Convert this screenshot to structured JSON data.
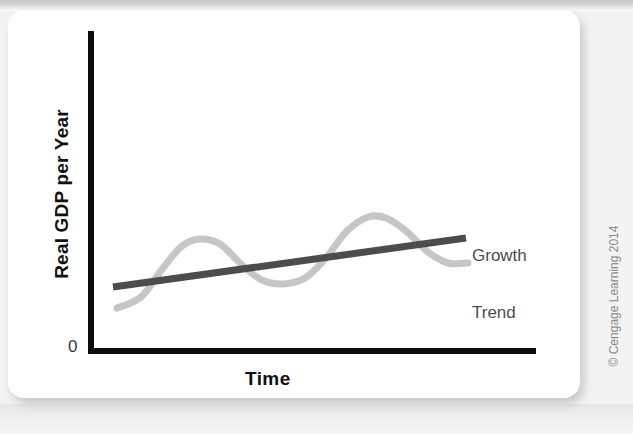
{
  "figure": {
    "credit": "© Cengage Learning 2014"
  },
  "chart_data": {
    "type": "line",
    "title": "",
    "subtitle": "",
    "xlabel": "Time",
    "ylabel": "Real GDP per Year",
    "origin_label": "0",
    "grid": false,
    "legend_position": "inline-right",
    "axis_color": "#0d0d0d",
    "xlim": [
      0,
      100
    ],
    "ylim": [
      0,
      100
    ],
    "x_tick_labels": [],
    "y_tick_labels": [
      "0"
    ],
    "annotations": [
      {
        "name": "growth-trend-label",
        "lines": [
          "Growth",
          "Trend"
        ],
        "x": 472,
        "y": 208,
        "color": "#4c4c4c"
      }
    ],
    "series": [
      {
        "name": "Business Cycle",
        "label": "",
        "type": "wave",
        "color": "#c6c6c6",
        "stroke_width": 7,
        "description": "Oscillating real GDP fluctuating around the long-run growth trend: starts low, rises to a first peak, falls to a trough, rises to a higher second peak, then falls toward the right edge.",
        "points": [
          {
            "x": 117,
            "y": 308
          },
          {
            "x": 141,
            "y": 297
          },
          {
            "x": 163,
            "y": 268
          },
          {
            "x": 182,
            "y": 246
          },
          {
            "x": 200,
            "y": 239
          },
          {
            "x": 220,
            "y": 244
          },
          {
            "x": 243,
            "y": 266
          },
          {
            "x": 262,
            "y": 280
          },
          {
            "x": 283,
            "y": 284
          },
          {
            "x": 305,
            "y": 278
          },
          {
            "x": 325,
            "y": 259
          },
          {
            "x": 347,
            "y": 231
          },
          {
            "x": 368,
            "y": 217
          },
          {
            "x": 386,
            "y": 218
          },
          {
            "x": 406,
            "y": 231
          },
          {
            "x": 428,
            "y": 252
          },
          {
            "x": 448,
            "y": 263
          },
          {
            "x": 468,
            "y": 263
          }
        ]
      },
      {
        "name": "Growth Trend",
        "label": "Growth Trend",
        "type": "line",
        "color": "#4c4c4c",
        "stroke_width": 7,
        "description": "Straight upward-sloping long-run growth trend line.",
        "points": [
          {
            "x": 113,
            "y": 287
          },
          {
            "x": 466,
            "y": 238
          }
        ]
      }
    ]
  },
  "axes": {
    "y_axis": {
      "x": 91,
      "y_top": 31,
      "y_bottom": 353,
      "width": 6
    },
    "x_axis": {
      "y": 351,
      "x_left": 88,
      "x_right": 536,
      "height": 6
    }
  }
}
